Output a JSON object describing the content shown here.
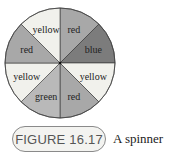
{
  "figure": {
    "number_label": "FIGURE 16.17",
    "caption": "A spinner"
  },
  "spinner": {
    "segments": [
      {
        "label": "red",
        "fill": "#a8a8a8"
      },
      {
        "label": "blue",
        "fill": "#7c7c7c"
      },
      {
        "label": "yellow",
        "fill": "#f1f1ec"
      },
      {
        "label": "red",
        "fill": "#a8a8a8"
      },
      {
        "label": "green",
        "fill": "#b9b9b9"
      },
      {
        "label": "yellow",
        "fill": "#f1f1ec"
      },
      {
        "label": "red",
        "fill": "#a8a8a8"
      },
      {
        "label": "yellow",
        "fill": "#f1f1ec"
      }
    ],
    "stroke": "#333333"
  }
}
